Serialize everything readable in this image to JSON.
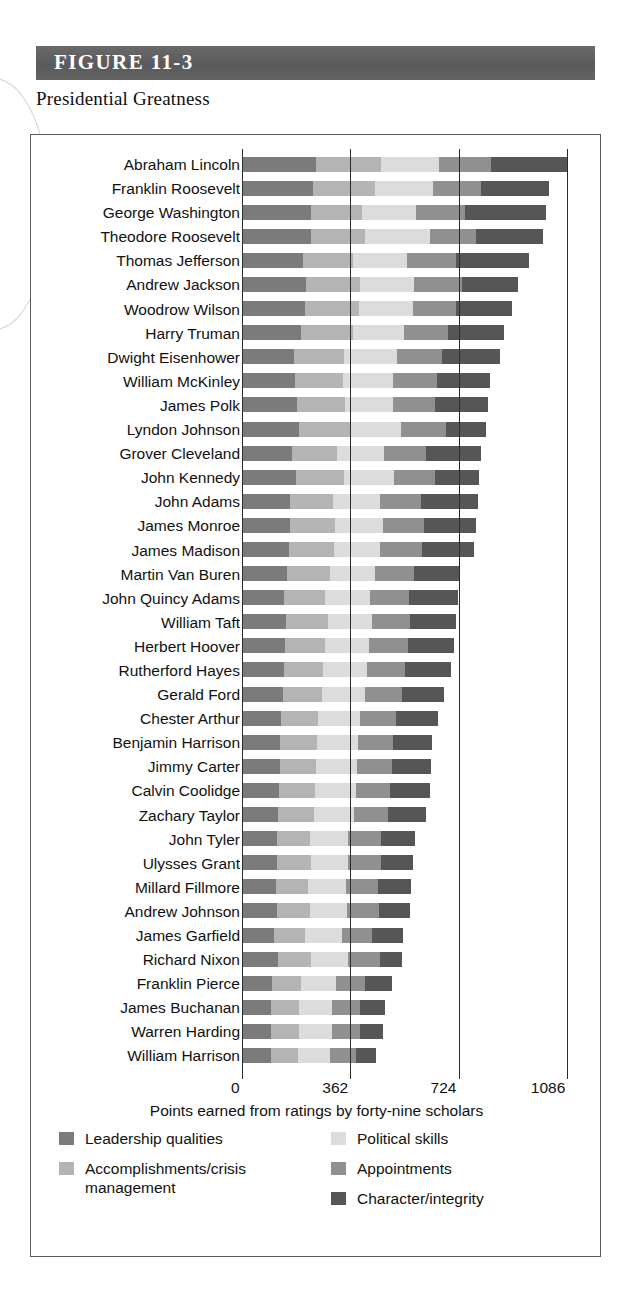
{
  "figure": {
    "band_label": "FIGURE 11-3",
    "subtitle": "Presidential Greatness"
  },
  "chart_data": {
    "type": "bar",
    "orientation": "horizontal",
    "stacked": true,
    "title": "Presidential Greatness",
    "xlabel": "Points earned from ratings by forty-nine scholars",
    "ylabel": "",
    "xlim": [
      0,
      1140
    ],
    "xticks": [
      0,
      362,
      724,
      1086
    ],
    "xtick_labels": [
      "0",
      "362",
      "724",
      "1086"
    ],
    "grid": "vertical gridlines at 362, 724, 1086",
    "legend_position": "below axis, two columns",
    "series": [
      {
        "name": "Leadership qualities",
        "color": "#7b7b7b"
      },
      {
        "name": "Accomplishments/crisis management",
        "color": "#b4b4b4"
      },
      {
        "name": "Political skills",
        "color": "#dcdcdc"
      },
      {
        "name": "Appointments",
        "color": "#909090"
      },
      {
        "name": "Character/integrity",
        "color": "#565656"
      }
    ],
    "categories": [
      "Abraham Lincoln",
      "Franklin Roosevelt",
      "George Washington",
      "Theodore Roosevelt",
      "Thomas Jefferson",
      "Andrew Jackson",
      "Woodrow Wilson",
      "Harry Truman",
      "Dwight Eisenhower",
      "William McKinley",
      "James Polk",
      "Lyndon Johnson",
      "Grover Cleveland",
      "John Kennedy",
      "John Adams",
      "James Monroe",
      "James Madison",
      "Martin Van Buren",
      "John Quincy Adams",
      "William Taft",
      "Herbert Hoover",
      "Rutherford Hayes",
      "Gerald Ford",
      "Chester Arthur",
      "Benjamin Harrison",
      "Jimmy Carter",
      "Calvin Coolidge",
      "Zachary Taylor",
      "John Tyler",
      "Ulysses Grant",
      "Millard Fillmore",
      "Andrew Johnson",
      "James Garfield",
      "Richard Nixon",
      "Franklin Pierce",
      "James Buchanan",
      "Warren Harding",
      "William Harrison"
    ],
    "rows": [
      {
        "name": "Abraham Lincoln",
        "total": 1086,
        "values": [
          247,
          218,
          193,
          176,
          252
        ]
      },
      {
        "name": "Franklin Roosevelt",
        "total": 1027,
        "values": [
          238,
          206,
          194,
          160,
          229
        ]
      },
      {
        "name": "George Washington",
        "total": 1018,
        "values": [
          230,
          172,
          180,
          165,
          271
        ]
      },
      {
        "name": "Theodore Roosevelt",
        "total": 1007,
        "values": [
          232,
          180,
          218,
          154,
          223
        ]
      },
      {
        "name": "Thomas Jefferson",
        "total": 959,
        "values": [
          203,
          168,
          182,
          164,
          242
        ]
      },
      {
        "name": "Andrew Jackson",
        "total": 923,
        "values": [
          215,
          180,
          180,
          160,
          188
        ]
      },
      {
        "name": "Woodrow Wilson",
        "total": 903,
        "values": [
          211,
          180,
          180,
          145,
          187
        ]
      },
      {
        "name": "Harry Truman",
        "total": 875,
        "values": [
          198,
          172,
          171,
          147,
          187
        ]
      },
      {
        "name": "Dwight Eisenhower",
        "total": 862,
        "values": [
          175,
          165,
          178,
          150,
          194
        ]
      },
      {
        "name": "William McKinley",
        "total": 828,
        "values": [
          178,
          160,
          168,
          145,
          177
        ]
      },
      {
        "name": "James Polk",
        "total": 821,
        "values": [
          183,
          162,
          159,
          142,
          175
        ]
      },
      {
        "name": "Lyndon Johnson",
        "total": 817,
        "values": [
          190,
          172,
          168,
          152,
          135
        ]
      },
      {
        "name": "Grover Cleveland",
        "total": 800,
        "values": [
          166,
          152,
          158,
          140,
          184
        ]
      },
      {
        "name": "John Kennedy",
        "total": 792,
        "values": [
          182,
          160,
          165,
          140,
          145
        ]
      },
      {
        "name": "John Adams",
        "total": 790,
        "values": [
          160,
          145,
          155,
          140,
          190
        ]
      },
      {
        "name": "James Monroe",
        "total": 782,
        "values": [
          162,
          150,
          158,
          138,
          174
        ]
      },
      {
        "name": "James Madison",
        "total": 776,
        "values": [
          158,
          148,
          157,
          138,
          175
        ]
      },
      {
        "name": "Martin Van Buren",
        "total": 730,
        "values": [
          152,
          142,
          150,
          132,
          154
        ]
      },
      {
        "name": "John Quincy Adams",
        "total": 723,
        "values": [
          142,
          136,
          150,
          130,
          165
        ]
      },
      {
        "name": "William Taft",
        "total": 714,
        "values": [
          148,
          138,
          148,
          128,
          152
        ]
      },
      {
        "name": "Herbert Hoover",
        "total": 708,
        "values": [
          144,
          132,
          150,
          128,
          154
        ]
      },
      {
        "name": "Rutherford Hayes",
        "total": 698,
        "values": [
          140,
          130,
          148,
          126,
          154
        ]
      },
      {
        "name": "Gerald Ford",
        "total": 676,
        "values": [
          138,
          128,
          146,
          122,
          142
        ]
      },
      {
        "name": "Chester Arthur",
        "total": 655,
        "values": [
          130,
          124,
          142,
          120,
          139
        ]
      },
      {
        "name": "Benjamin Harrison",
        "total": 635,
        "values": [
          128,
          122,
          138,
          118,
          129
        ]
      },
      {
        "name": "Jimmy Carter",
        "total": 632,
        "values": [
          126,
          122,
          136,
          116,
          132
        ]
      },
      {
        "name": "Calvin Coolidge",
        "total": 628,
        "values": [
          124,
          120,
          136,
          116,
          132
        ]
      },
      {
        "name": "Zachary Taylor",
        "total": 615,
        "values": [
          122,
          118,
          134,
          114,
          127
        ]
      },
      {
        "name": "John Tyler",
        "total": 578,
        "values": [
          116,
          112,
          128,
          108,
          114
        ]
      },
      {
        "name": "Ulysses Grant",
        "total": 572,
        "values": [
          118,
          112,
          126,
          110,
          106
        ]
      },
      {
        "name": "Millard Fillmore",
        "total": 566,
        "values": [
          112,
          110,
          126,
          106,
          112
        ]
      },
      {
        "name": "Andrew Johnson",
        "total": 562,
        "values": [
          116,
          110,
          124,
          108,
          104
        ]
      },
      {
        "name": "James Garfield",
        "total": 540,
        "values": [
          108,
          104,
          122,
          102,
          104
        ]
      },
      {
        "name": "Richard Nixon",
        "total": 534,
        "values": [
          120,
          112,
          124,
          106,
          72
        ]
      },
      {
        "name": "Franklin Pierce",
        "total": 500,
        "values": [
          100,
          98,
          116,
          96,
          90
        ]
      },
      {
        "name": "James Buchanan",
        "total": 478,
        "values": [
          96,
          94,
          112,
          92,
          84
        ]
      },
      {
        "name": "Warren Harding",
        "total": 472,
        "values": [
          96,
          94,
          112,
          92,
          78
        ]
      },
      {
        "name": "William Harrison",
        "total": 448,
        "values": [
          96,
          90,
          108,
          88,
          66
        ]
      }
    ]
  },
  "legend": {
    "items": [
      {
        "label": "Leadership qualities",
        "color": "#7b7b7b"
      },
      {
        "label": "Political skills",
        "color": "#dcdcdc"
      },
      {
        "label": "Accomplishments/crisis management",
        "color": "#b4b4b4"
      },
      {
        "label": "Appointments",
        "color": "#909090"
      },
      {
        "label": "Character/integrity",
        "color": "#565656"
      }
    ]
  }
}
